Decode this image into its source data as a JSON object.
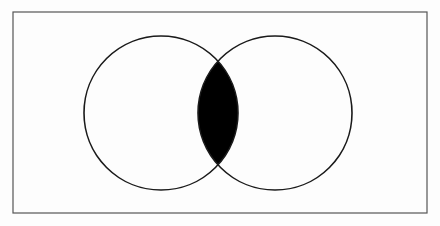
{
  "diagram": {
    "type": "venn",
    "frame": {
      "x": 13,
      "y": 12,
      "width": 414,
      "height": 201,
      "stroke": "#555555"
    },
    "sets": [
      {
        "name": "A",
        "cx": 161,
        "cy": 113,
        "r": 77,
        "shaded": false
      },
      {
        "name": "B",
        "cx": 275,
        "cy": 113,
        "r": 77,
        "shaded": false
      }
    ],
    "intersection": {
      "shaded": true,
      "fill": "#000000"
    },
    "colors": {
      "background": "#fdfdfd",
      "stroke": "#1a1a1a",
      "shade": "#000000"
    }
  }
}
